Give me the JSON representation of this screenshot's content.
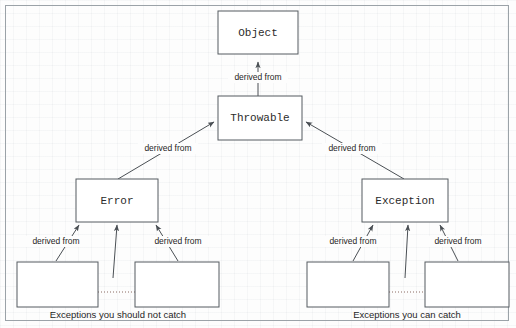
{
  "figure": {
    "background_color": "#fdfdfd",
    "frame_color": "#9ba2a8",
    "box_fill": "#ffffff",
    "box_stroke": "#555b60",
    "edge_color": "#4a4f54",
    "dotted_edge_color": "#8a6a62"
  },
  "nodes": {
    "object": {
      "label": "Object"
    },
    "throwable": {
      "label": "Throwable"
    },
    "error": {
      "label": "Error"
    },
    "exception": {
      "label": "Exception"
    },
    "error_sub_left": {
      "label": ""
    },
    "error_sub_right": {
      "label": ""
    },
    "exception_sub_left": {
      "label": ""
    },
    "exception_sub_right": {
      "label": ""
    }
  },
  "edges": {
    "throwable_to_object": {
      "label": "derived from"
    },
    "error_to_throwable": {
      "label": "derived from"
    },
    "exception_to_throwable": {
      "label": "derived from"
    },
    "error_sub_left_to_error": {
      "label": "derived from"
    },
    "error_sub_right_to_error": {
      "label": "derived from"
    },
    "exception_sub_left_to_exception": {
      "label": "derived from"
    },
    "exception_sub_right_to_exception": {
      "label": "derived from"
    }
  },
  "captions": {
    "left": "Exceptions you should not catch",
    "right": "Exceptions you can catch"
  }
}
